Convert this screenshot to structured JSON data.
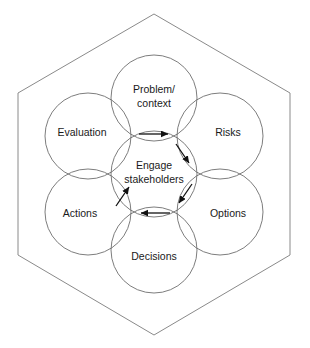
{
  "diagram": {
    "type": "overlapping-circles-hexagon",
    "colors": {
      "hexagon_stroke": "#8a8a8a",
      "circle_stroke": "#6e6e6e",
      "arrow": "#111111",
      "text": "#1a1a1a",
      "background": "#ffffff"
    },
    "hexagon": {
      "name": "outer-hexagon",
      "points": "154,14 290,93 290,255 154,335 18,255 18,93"
    },
    "center": {
      "name": "center-circle",
      "label_line1": "Engage",
      "label_line2": "stakeholders",
      "cx": 154,
      "cy": 174,
      "r": 43
    },
    "petals": [
      {
        "name": "problem-context",
        "label_line1": "Problem/",
        "label_line2": "context",
        "cx": 154,
        "cy": 98,
        "r": 43,
        "text_x": 154,
        "text_y": 90
      },
      {
        "name": "risks",
        "label_line1": "Risks",
        "label_line2": "",
        "cx": 220,
        "cy": 136,
        "r": 43,
        "text_x": 228,
        "text_y": 133
      },
      {
        "name": "options",
        "label_line1": "Options",
        "label_line2": "",
        "cx": 220,
        "cy": 212,
        "r": 43,
        "text_x": 228,
        "text_y": 214
      },
      {
        "name": "decisions",
        "label_line1": "Decisions",
        "label_line2": "",
        "cx": 154,
        "cy": 250,
        "r": 43,
        "text_x": 154,
        "text_y": 257
      },
      {
        "name": "actions",
        "label_line1": "Actions",
        "label_line2": "",
        "cx": 88,
        "cy": 212,
        "r": 43,
        "text_x": 80,
        "text_y": 214
      },
      {
        "name": "evaluation",
        "label_line1": "Evaluation",
        "label_line2": "",
        "cx": 88,
        "cy": 136,
        "r": 43,
        "text_x": 82,
        "text_y": 133
      }
    ],
    "arrows": [
      {
        "name": "arrow-problem-to-risks",
        "direction": "right",
        "x1": 139,
        "y1": 134,
        "x2": 170,
        "y2": 134
      },
      {
        "name": "arrow-risks-to-options",
        "direction": "down-right",
        "x1": 176,
        "y1": 144,
        "x2": 190,
        "y2": 165
      },
      {
        "name": "arrow-options-to-decisions",
        "direction": "down-left",
        "x1": 192,
        "y1": 184,
        "x2": 178,
        "y2": 205
      },
      {
        "name": "arrow-decisions-to-actions",
        "direction": "left",
        "x1": 170,
        "y1": 213,
        "x2": 139,
        "y2": 213
      },
      {
        "name": "arrow-actions-to-evaluation",
        "direction": "up-right",
        "x1": 116,
        "y1": 206,
        "x2": 130,
        "y2": 185
      }
    ]
  }
}
